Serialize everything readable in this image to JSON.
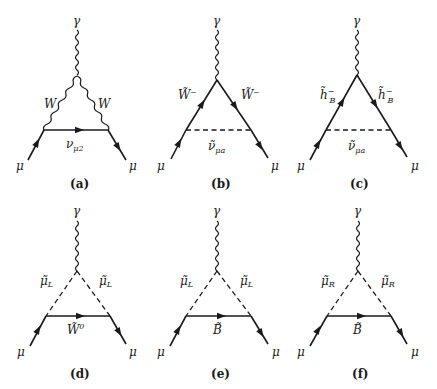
{
  "figure": {
    "panels": [
      {
        "id": "a",
        "caption": "(a)",
        "photon_label": "γ",
        "left_edge_label": "W",
        "right_edge_label": "W",
        "bottom_label_main": "ν",
        "bottom_label_sub": "μ2",
        "incoming_label": "μ",
        "outgoing_label": "μ",
        "edge_types": {
          "left": "wavy",
          "right": "wavy",
          "bottom": "solid-arrow"
        }
      },
      {
        "id": "b",
        "caption": "(b)",
        "photon_label": "γ",
        "left_edge_label": "W̃⁻",
        "right_edge_label": "W̃⁻",
        "bottom_label_main": "ν̃",
        "bottom_label_sub": "μa",
        "incoming_label": "μ",
        "outgoing_label": "μ",
        "edge_types": {
          "left": "solid-arrow",
          "right": "solid-arrow",
          "bottom": "dashed"
        }
      },
      {
        "id": "c",
        "caption": "(c)",
        "photon_label": "γ",
        "left_edge_label_main": "h̃",
        "left_edge_label_sup": "−",
        "left_edge_label_sub": "B",
        "right_edge_label_main": "h̃",
        "right_edge_label_sup": "−",
        "right_edge_label_sub": "B",
        "bottom_label_main": "ν̃",
        "bottom_label_sub": "μa",
        "incoming_label": "μ",
        "outgoing_label": "μ",
        "edge_types": {
          "left": "solid-arrow",
          "right": "solid-arrow",
          "bottom": "dashed"
        }
      },
      {
        "id": "d",
        "caption": "(d)",
        "photon_label": "γ",
        "left_edge_label_main": "μ̃",
        "left_edge_label_sub": "L",
        "right_edge_label_main": "μ̃",
        "right_edge_label_sub": "L",
        "bottom_label_main": "W̃",
        "bottom_label_sup": "0",
        "incoming_label": "μ",
        "outgoing_label": "μ",
        "edge_types": {
          "left": "dashed",
          "right": "dashed",
          "bottom": "solid-arrow"
        }
      },
      {
        "id": "e",
        "caption": "(e)",
        "photon_label": "γ",
        "left_edge_label_main": "μ̃",
        "left_edge_label_sub": "L",
        "right_edge_label_main": "μ̃",
        "right_edge_label_sub": "L",
        "bottom_label_main": "B̃",
        "incoming_label": "μ",
        "outgoing_label": "μ",
        "edge_types": {
          "left": "dashed",
          "right": "dashed",
          "bottom": "solid-arrow"
        }
      },
      {
        "id": "f",
        "caption": "(f)",
        "photon_label": "γ",
        "left_edge_label_main": "μ̃",
        "left_edge_label_sub": "R",
        "right_edge_label_main": "μ̃",
        "right_edge_label_sub": "R",
        "bottom_label_main": "B̃",
        "incoming_label": "μ",
        "outgoing_label": "μ",
        "edge_types": {
          "left": "dashed",
          "right": "dashed",
          "bottom": "solid-arrow"
        }
      }
    ]
  }
}
